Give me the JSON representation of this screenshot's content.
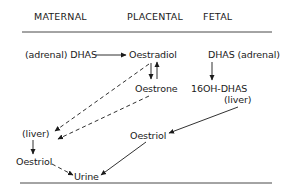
{
  "headers": {
    "maternal": "MATERNAL",
    "placental": "PLACENTAL",
    "fetal": "FETAL"
  },
  "nodes": {
    "maternal_dhas": "(adrenal) DHAS",
    "oestradiol": "Oestradiol",
    "fetal_dhas": "DHAS (adrenal)",
    "oestrone": "Oestrone",
    "hydroxy_dhas": "16OH-DHAS",
    "fetal_liver": "(liver)",
    "maternal_liver": "(liver)",
    "placental_oestriol": "Oestriol",
    "maternal_oestriol": "Oestriol",
    "urine": "Urine"
  },
  "edges": [
    {
      "from": "maternal_dhas",
      "to": "oestradiol",
      "style": "solid"
    },
    {
      "from": "oestradiol",
      "to": "oestrone",
      "style": "solid"
    },
    {
      "from": "oestrone",
      "to": "oestradiol",
      "style": "solid"
    },
    {
      "from": "fetal_dhas",
      "to": "hydroxy_dhas",
      "style": "solid"
    },
    {
      "from": "oestradiol",
      "to": "maternal_liver",
      "style": "dashed"
    },
    {
      "from": "oestrone",
      "to": "maternal_liver",
      "style": "dashed"
    },
    {
      "from": "fetal_liver",
      "to": "placental_oestriol",
      "style": "solid"
    },
    {
      "from": "maternal_liver",
      "to": "maternal_oestriol",
      "style": "solid"
    },
    {
      "from": "maternal_oestriol",
      "to": "urine",
      "style": "dashed"
    },
    {
      "from": "placental_oestriol",
      "to": "urine",
      "style": "solid"
    }
  ],
  "colors": {
    "ink": "#1a1a1a",
    "background": "#ffffff"
  }
}
